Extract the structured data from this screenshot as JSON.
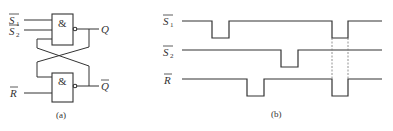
{
  "panel_a": {
    "caption": "(a)",
    "gate_symbol": "&",
    "inputs": {
      "s1": {
        "letter": "S",
        "sub": "1"
      },
      "s2": {
        "letter": "S",
        "sub": "2"
      },
      "r": {
        "letter": "R"
      }
    },
    "outputs": {
      "q": "Q",
      "q_bar": "Q"
    }
  },
  "panel_b": {
    "caption": "(b)",
    "signals": [
      {
        "name": "S1",
        "letter": "S",
        "sub": "1"
      },
      {
        "name": "S2",
        "letter": "S",
        "sub": "2"
      },
      {
        "name": "R",
        "letter": "R"
      }
    ]
  },
  "colors": {
    "line": "#333333",
    "dashed": "#777777",
    "background": "#ffffff"
  }
}
